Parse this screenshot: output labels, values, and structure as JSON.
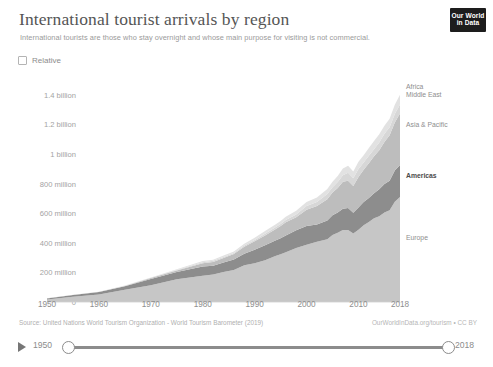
{
  "header": {
    "title": "International tourist arrivals by region",
    "subtitle": "International tourists are those who stay overnight and whose main purpose for visiting is not commercial.",
    "logo_line1": "Our World",
    "logo_line2": "in Data"
  },
  "controls": {
    "relative_label": "Relative",
    "relative_checked": false
  },
  "footer": {
    "source": "Source: United Nations World Tourism Organization - World Tourism Barometer (2019)",
    "link": "OurWorldInData.org/tourism • CC BY"
  },
  "time_slider": {
    "play_icon": "play-icon",
    "min_year": "1950",
    "max_year": "2018"
  },
  "colors": {
    "europe": "#c6c6c6",
    "americas": "#8d8d8d",
    "asia_pacific": "#bdbdbd",
    "middle_east": "#d7d7d7",
    "africa": "#e2e2e2",
    "axis_text": "#a3a3a3",
    "title_text": "#555555",
    "logo_bg": "#1d1d1d"
  },
  "chart_data": {
    "type": "area",
    "stacked": true,
    "title": "International tourist arrivals by region",
    "subtitle": "International tourists are those who stay overnight and whose main purpose for visiting is not commercial.",
    "xlabel": "",
    "ylabel": "",
    "xlim": [
      1950,
      2018
    ],
    "ylim": [
      0,
      1500000000
    ],
    "grid": false,
    "legend_position": "right-inline",
    "ytick_labels": [
      "0",
      "200 million",
      "400 million",
      "600 million",
      "800 million",
      "1 billion",
      "1.2 billion",
      "1.4 billion"
    ],
    "ytick_values": [
      0,
      200000000,
      400000000,
      600000000,
      800000000,
      1000000000,
      1200000000,
      1400000000
    ],
    "xtick_labels": [
      "1950",
      "1960",
      "1970",
      "1980",
      "1990",
      "2000",
      "2010",
      "2018"
    ],
    "xtick_values": [
      1950,
      1960,
      1970,
      1980,
      1990,
      2000,
      2010,
      2018
    ],
    "x": [
      1950,
      1955,
      1960,
      1965,
      1970,
      1975,
      1980,
      1982,
      1984,
      1986,
      1988,
      1990,
      1992,
      1994,
      1995,
      1996,
      1998,
      2000,
      2002,
      2004,
      2005,
      2006,
      2007,
      2008,
      2009,
      2010,
      2011,
      2012,
      2013,
      2014,
      2015,
      2016,
      2017,
      2018
    ],
    "series": [
      {
        "name": "Europe",
        "color": "#c6c6c6",
        "values": [
          16800000,
          36000000,
          50400000,
          83000000,
          113000000,
          153000000,
          177000000,
          185000000,
          202000000,
          216000000,
          248000000,
          261000000,
          282000000,
          310000000,
          322000000,
          336000000,
          365000000,
          386000000,
          407000000,
          424000000,
          453000000,
          468000000,
          487000000,
          487000000,
          462000000,
          489000000,
          519000000,
          540000000,
          566000000,
          580000000,
          604000000,
          620000000,
          677000000,
          710000000
        ]
      },
      {
        "name": "Americas",
        "color": "#8d8d8d",
        "values": [
          7500000,
          11000000,
          16700000,
          23200000,
          42300000,
          50000000,
          62300000,
          60000000,
          65000000,
          71000000,
          78000000,
          92800000,
          102000000,
          105000000,
          109000000,
          114000000,
          119000000,
          128000000,
          117000000,
          126000000,
          133000000,
          136000000,
          143000000,
          148000000,
          141000000,
          150000000,
          156000000,
          163000000,
          168000000,
          181000000,
          193000000,
          200000000,
          211000000,
          216000000
        ]
      },
      {
        "name": "Asia & Pacific",
        "color": "#bdbdbd",
        "values": [
          200000,
          500000,
          900000,
          2100000,
          6200000,
          10200000,
          23000000,
          26000000,
          30000000,
          37000000,
          47000000,
          56000000,
          66000000,
          77000000,
          82000000,
          89000000,
          89000000,
          110000000,
          124000000,
          145000000,
          154000000,
          167000000,
          182000000,
          184000000,
          181000000,
          205000000,
          218000000,
          234000000,
          250000000,
          264000000,
          284000000,
          306000000,
          324000000,
          348000000
        ]
      },
      {
        "name": "Middle East",
        "color": "#d7d7d7",
        "values": [
          200000,
          300000,
          600000,
          1300000,
          1900000,
          3500000,
          7100000,
          7500000,
          7800000,
          7300000,
          8900000,
          9600000,
          11000000,
          13000000,
          14000000,
          15000000,
          18000000,
          24000000,
          28000000,
          35000000,
          36000000,
          40000000,
          45000000,
          55000000,
          52000000,
          54000000,
          49000000,
          51000000,
          48000000,
          52000000,
          56000000,
          55000000,
          58000000,
          60000000
        ]
      },
      {
        "name": "Africa",
        "color": "#e2e2e2",
        "values": [
          500000,
          700000,
          800000,
          1400000,
          2400000,
          4700000,
          7200000,
          7800000,
          8700000,
          9500000,
          12500000,
          15200000,
          17900000,
          18800000,
          20000000,
          22000000,
          25000000,
          27000000,
          30000000,
          34000000,
          37000000,
          41000000,
          45000000,
          47000000,
          46000000,
          50000000,
          50000000,
          53000000,
          55000000,
          56000000,
          54000000,
          58000000,
          63000000,
          67000000
        ]
      }
    ],
    "inline_labels": [
      {
        "name": "Africa",
        "emphasis": false
      },
      {
        "name": "Middle East",
        "emphasis": false
      },
      {
        "name": "Asia & Pacific",
        "emphasis": false
      },
      {
        "name": "Americas",
        "emphasis": true
      },
      {
        "name": "Europe",
        "emphasis": false
      }
    ]
  }
}
